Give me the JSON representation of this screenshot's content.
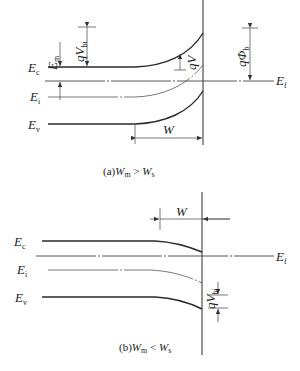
{
  "figure": {
    "panel_a": {
      "caption": {
        "prefix": "(a)",
        "left": "W",
        "left_sub": "m",
        "relation": " > ",
        "right": "W",
        "right_sub": "s"
      },
      "labels": {
        "Ec": {
          "main": "E",
          "sub": "c"
        },
        "Ei": {
          "main": "E",
          "sub": "i"
        },
        "Ev": {
          "main": "E",
          "sub": "v"
        },
        "Ef": {
          "main": "E",
          "sub": "f"
        },
        "Em": {
          "main": "E",
          "sub": "m"
        },
        "qVbi": {
          "main": "qV",
          "sub": "bi"
        },
        "qV": {
          "main": "qV"
        },
        "qPhib": {
          "main": "qΦ",
          "sub": "b"
        },
        "W": {
          "main": "W"
        }
      }
    },
    "panel_b": {
      "caption": {
        "prefix": "(b)",
        "left": "W",
        "left_sub": "m",
        "relation": " < ",
        "right": "W",
        "right_sub": "s"
      },
      "labels": {
        "Ec": {
          "main": "E",
          "sub": "c"
        },
        "Ei": {
          "main": "E",
          "sub": "i"
        },
        "Ev": {
          "main": "E",
          "sub": "v"
        },
        "Ef": {
          "main": "E",
          "sub": "f"
        },
        "qVbi": {
          "main": "qV",
          "sub": "bi"
        },
        "W": {
          "main": "W"
        }
      }
    }
  }
}
